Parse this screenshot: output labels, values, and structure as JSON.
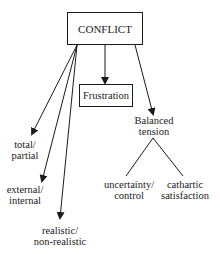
{
  "diagram": {
    "root": {
      "label": "CONFLICT"
    },
    "children": {
      "frustration": {
        "label": "Frustration"
      },
      "balanced_tension": {
        "line1": "Balanced",
        "line2": "tension"
      },
      "total_partial": {
        "line1": "total/",
        "line2": "partial"
      },
      "external_internal": {
        "line1": "external/",
        "line2": "internal"
      },
      "realistic": {
        "line1": "realistic/",
        "line2": "non-realistic"
      }
    },
    "balanced_tension_children": {
      "uncertainty": {
        "line1": "uncertainty/",
        "line2": "control"
      },
      "cathartic": {
        "line1": "cathartic",
        "line2": "satisfaction"
      }
    },
    "colors": {
      "stroke": "#1a1a1a",
      "background": "#ffffff"
    }
  }
}
